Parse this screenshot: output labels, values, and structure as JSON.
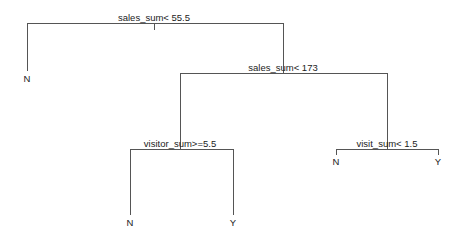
{
  "diagram": {
    "type": "decision-tree",
    "nodes": {
      "root": {
        "label": "sales_sum< 55.5"
      },
      "n2": {
        "label": "sales_sum< 173"
      },
      "n3": {
        "label": "visitor_sum>=5.5"
      },
      "n4": {
        "label": "visit_sum< 1.5"
      }
    },
    "leaves": {
      "l1": {
        "label": "N"
      },
      "l2": {
        "label": "N"
      },
      "l3": {
        "label": "Y"
      },
      "l4": {
        "label": "N"
      },
      "l5": {
        "label": "Y"
      }
    },
    "colors": {
      "edge": "#555555",
      "text": "#222222",
      "background": "#ffffff"
    }
  }
}
